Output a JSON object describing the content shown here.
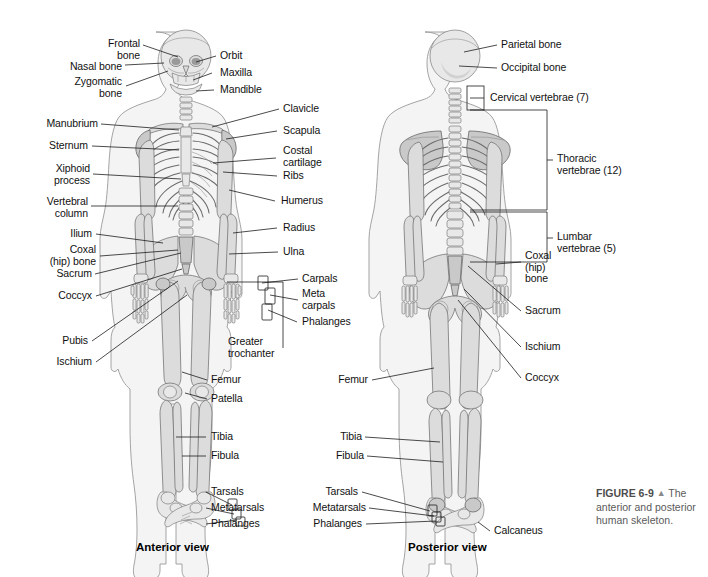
{
  "figure": {
    "number": "FIGURE 6-9",
    "marker": "▲",
    "caption_lead": "The",
    "caption_rest": "anterior and posterior human skeleton."
  },
  "views": {
    "anterior_caption": "Anterior view",
    "posterior_caption": "Posterior view"
  },
  "anterior": {
    "left_labels": [
      {
        "id": "frontal-bone",
        "text": "Frontal\nbone"
      },
      {
        "id": "nasal-bone",
        "text": "Nasal bone"
      },
      {
        "id": "zygomatic-bone",
        "text": "Zygomatic\nbone"
      },
      {
        "id": "manubrium",
        "text": "Manubrium"
      },
      {
        "id": "sternum",
        "text": "Sternum"
      },
      {
        "id": "xiphoid-process",
        "text": "Xiphoid\nprocess"
      },
      {
        "id": "vertebral-column",
        "text": "Vertebral\ncolumn"
      },
      {
        "id": "ilium",
        "text": "Ilium"
      },
      {
        "id": "coxal-hip-bone",
        "text": "Coxal\n(hip) bone"
      },
      {
        "id": "sacrum",
        "text": "Sacrum"
      },
      {
        "id": "coccyx",
        "text": "Coccyx"
      },
      {
        "id": "pubis",
        "text": "Pubis"
      },
      {
        "id": "ischium",
        "text": "Ischium"
      }
    ],
    "right_labels": [
      {
        "id": "orbit",
        "text": "Orbit"
      },
      {
        "id": "maxilla",
        "text": "Maxilla"
      },
      {
        "id": "mandible",
        "text": "Mandible"
      },
      {
        "id": "clavicle",
        "text": "Clavicle"
      },
      {
        "id": "scapula",
        "text": "Scapula"
      },
      {
        "id": "costal-cartilage",
        "text": "Costal\ncartilage"
      },
      {
        "id": "ribs",
        "text": "Ribs"
      },
      {
        "id": "humerus",
        "text": "Humerus"
      },
      {
        "id": "radius",
        "text": "Radius"
      },
      {
        "id": "ulna",
        "text": "Ulna"
      },
      {
        "id": "carpals",
        "text": "Carpals"
      },
      {
        "id": "metacarpals",
        "text": "Meta\ncarpals"
      },
      {
        "id": "phalanges-hand",
        "text": "Phalanges"
      },
      {
        "id": "greater-trochanter",
        "text": "Greater\ntrochanter"
      },
      {
        "id": "femur",
        "text": "Femur"
      },
      {
        "id": "patella",
        "text": "Patella"
      },
      {
        "id": "tibia",
        "text": "Tibia"
      },
      {
        "id": "fibula",
        "text": "Fibula"
      },
      {
        "id": "tarsals",
        "text": "Tarsals"
      },
      {
        "id": "metatarsals",
        "text": "Metatarsals"
      },
      {
        "id": "phalanges-foot",
        "text": "Phalanges"
      }
    ]
  },
  "posterior": {
    "left_labels": [
      {
        "id": "femur-p",
        "text": "Femur"
      },
      {
        "id": "tibia-p",
        "text": "Tibia"
      },
      {
        "id": "fibula-p",
        "text": "Fibula"
      },
      {
        "id": "tarsals-p",
        "text": "Tarsals"
      },
      {
        "id": "metatarsals-p",
        "text": "Metatarsals"
      },
      {
        "id": "phalanges-p",
        "text": "Phalanges"
      }
    ],
    "right_labels": [
      {
        "id": "parietal-bone",
        "text": "Parietal bone"
      },
      {
        "id": "occipital-bone",
        "text": "Occipital bone"
      },
      {
        "id": "cervical-vertebrae",
        "text": "Cervical vertebrae (7)"
      },
      {
        "id": "thoracic-vertebrae",
        "text": "Thoracic\nvertebrae (12)"
      },
      {
        "id": "lumbar-vertebrae",
        "text": "Lumbar\nvertebrae (5)"
      },
      {
        "id": "coxal-hip-bone-p",
        "text": "Coxal\n(hip)\nbone"
      },
      {
        "id": "sacrum-p",
        "text": "Sacrum"
      },
      {
        "id": "ischium-p",
        "text": "Ischium"
      },
      {
        "id": "coccyx-p",
        "text": "Coccyx"
      },
      {
        "id": "calcaneus",
        "text": "Calcaneus"
      }
    ]
  },
  "colors": {
    "background": "#ffffff",
    "label_text": "#111111",
    "leader_line": "#1d1d1d",
    "caption_text": "#5a5a5a",
    "body_fill": "#f4f4f4",
    "bone_fill": "#dcdcdc"
  }
}
